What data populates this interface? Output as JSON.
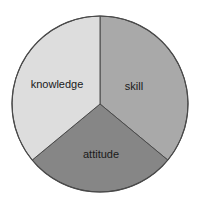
{
  "chart_data": {
    "type": "pie",
    "title": "",
    "categories": [
      "skill",
      "attitude",
      "knowledge"
    ],
    "values": [
      36,
      28,
      36
    ],
    "unit": "approx. % of circle (no numeric labels shown)",
    "colors": [
      "#a9a9a9",
      "#868686",
      "#dddddd"
    ],
    "start_angle_deg": 90,
    "direction": "clockwise",
    "legend": "none",
    "labels_inside": true
  },
  "labels": {
    "skill": "skill",
    "attitude": "attitude",
    "knowledge": "knowledge"
  },
  "geometry": {
    "cx": 100,
    "cy": 104,
    "r": 88
  }
}
